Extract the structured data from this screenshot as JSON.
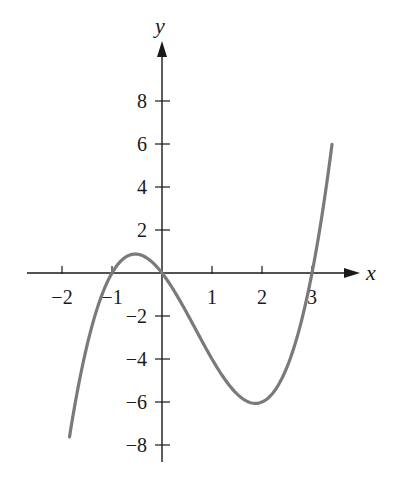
{
  "chart_data": {
    "type": "line",
    "title": "",
    "xlabel": "x",
    "ylabel": "y",
    "function": "y = x^3 - 2x^2 - 3x",
    "xlim": [
      -2.2,
      3.6
    ],
    "ylim": [
      -8.5,
      10
    ],
    "x_ticks": [
      -2,
      -1,
      1,
      2,
      3
    ],
    "x_tick_labels": [
      "−2",
      "−1",
      "1",
      "2",
      "3"
    ],
    "y_ticks": [
      8,
      6,
      4,
      2,
      -2,
      -4,
      -6,
      -8
    ],
    "y_tick_labels": [
      "8",
      "6",
      "4",
      "2",
      "−2",
      "−4",
      "−6",
      "−8"
    ],
    "grid": false,
    "legend": null,
    "series": [
      {
        "name": "curve",
        "color": "#7a7a7a",
        "x_range": [
          -1.85,
          3.4
        ],
        "key_points": [
          {
            "x": -1.85,
            "y": -7.6
          },
          {
            "x": -1,
            "y": 0
          },
          {
            "x": -0.55,
            "y": 0.88
          },
          {
            "x": 0,
            "y": 0
          },
          {
            "x": 2,
            "y": -6
          },
          {
            "x": 3,
            "y": 0
          },
          {
            "x": 3.4,
            "y": 6.0
          }
        ]
      }
    ]
  },
  "axes": {
    "x_label": "x",
    "y_label": "y",
    "color": "#1a1a1a"
  }
}
